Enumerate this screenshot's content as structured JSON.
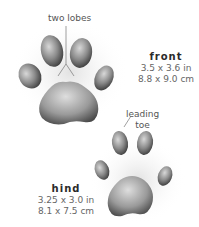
{
  "labels": {
    "two_lobes": "two lobes",
    "leading_toe_1": "leading",
    "leading_toe_2": "toe"
  },
  "front": {
    "title": "front",
    "size_in": "3.5 x 3.6 in",
    "size_cm": "8.8 x 9.0 cm"
  },
  "hind": {
    "title": "hind",
    "size_in": "3.25 x 3.0 in",
    "size_cm": "8.1 x 7.5 cm"
  }
}
